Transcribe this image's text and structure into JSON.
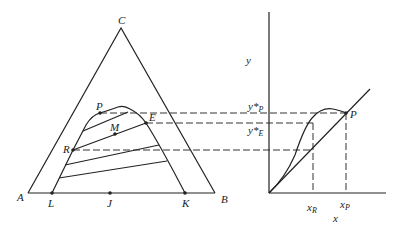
{
  "triangle": {
    "vertices": {
      "A": "A",
      "B": "B",
      "C": "C"
    },
    "points": {
      "L": "L",
      "J": "J",
      "K": "K",
      "P": "P",
      "E": "E",
      "M": "M",
      "R": "R"
    }
  },
  "xy_plot": {
    "y_axis_label": "y",
    "x_axis_label": "x",
    "point_label": "P",
    "y_labels": [
      {
        "base": "y*",
        "sub": "P"
      },
      {
        "base": "y*",
        "sub": "E"
      }
    ],
    "x_labels": [
      {
        "base": "x",
        "sub": "R"
      },
      {
        "base": "x",
        "sub": "P"
      }
    ]
  }
}
